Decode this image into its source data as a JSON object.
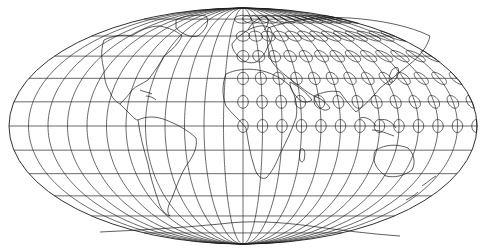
{
  "map": {
    "projection": "mollweide",
    "background": "#ffffff",
    "line_color": "#222222",
    "center": {
      "x": 243,
      "y": 126
    },
    "semi_axes": {
      "rx": 234,
      "ry": 118
    },
    "graticule": {
      "lon_step_deg": 15,
      "lat_step_deg": 15
    },
    "tissot_indicatrices": {
      "lon_start_deg": 0,
      "lon_end_deg": 180,
      "lon_step_deg": 15,
      "lat_start_deg": 0,
      "lat_end_deg": 75,
      "lat_step_deg": 15,
      "radius_deg": 4
    }
  }
}
